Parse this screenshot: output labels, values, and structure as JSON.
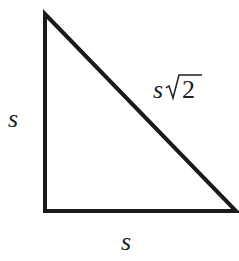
{
  "diagram": {
    "type": "right-isosceles-triangle",
    "stroke_color": "#1a1a1a",
    "vertices": {
      "top": [
        45,
        14
      ],
      "bottom_left": [
        45,
        211
      ],
      "bottom_right": [
        236,
        211
      ]
    },
    "labels": {
      "left_side": "s",
      "bottom_side": "s",
      "hypotenuse_var": "s",
      "hypotenuse_radicand": "2"
    }
  }
}
